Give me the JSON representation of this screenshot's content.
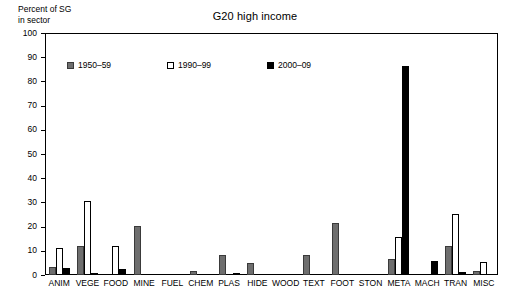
{
  "chart_data": {
    "type": "bar",
    "title": "G20 high income",
    "ylabel": "Percent of SG\nin sector",
    "xlabel": "",
    "ylim": [
      0,
      100
    ],
    "ytick_step": 10,
    "yticks": [
      0,
      10,
      20,
      30,
      40,
      50,
      60,
      70,
      80,
      90,
      100
    ],
    "grid": false,
    "legend_position": "inside-top-left",
    "categories": [
      "ANIM",
      "VEGE",
      "FOOD",
      "MINE",
      "FUEL",
      "CHEM",
      "PLAS",
      "HIDE",
      "WOOD",
      "TEXT",
      "FOOT",
      "STON",
      "META",
      "MACH",
      "TRAN",
      "MISC"
    ],
    "series": [
      {
        "name": "1950–59",
        "color": "#6e6e6e",
        "values": [
          3.5,
          12.0,
          0.0,
          20.2,
          0.0,
          1.6,
          8.4,
          5.1,
          0.0,
          8.4,
          21.7,
          0.0,
          6.7,
          0.0,
          11.8,
          1.6
        ]
      },
      {
        "name": "1990–99",
        "color": "#ffffff",
        "values": [
          11.2,
          30.5,
          12.0,
          0.0,
          0.0,
          0.0,
          0.0,
          0.0,
          0.0,
          0.0,
          0.0,
          0.0,
          15.7,
          0.0,
          25.4,
          5.4
        ]
      },
      {
        "name": "2000–09",
        "color": "#000000",
        "values": [
          2.7,
          0.4,
          2.3,
          0.0,
          0.0,
          0.0,
          0.5,
          0.0,
          0.0,
          0.0,
          0.0,
          0.0,
          86.3,
          5.8,
          1.1,
          0.0
        ]
      }
    ]
  }
}
